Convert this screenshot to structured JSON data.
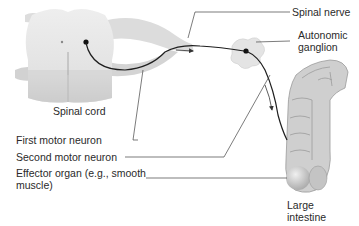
{
  "diagram": {
    "labels": {
      "spinal_nerve": "Spinal nerve",
      "autonomic_ganglion_1": "Autonomic",
      "autonomic_ganglion_2": "ganglion",
      "spinal_cord": "Spinal cord",
      "first_motor_neuron": "First motor neuron",
      "second_motor_neuron": "Second motor neuron",
      "effector_organ_1": "Effector organ (e.g., smooth",
      "effector_organ_2": "muscle)",
      "large_intestine_1": "Large",
      "large_intestine_2": "intestine"
    },
    "colors": {
      "tissue": "#e6e6e6",
      "tissue_shadow": "#c4c4c4",
      "neuron": "#1e1e1e",
      "leader": "#444444"
    }
  }
}
